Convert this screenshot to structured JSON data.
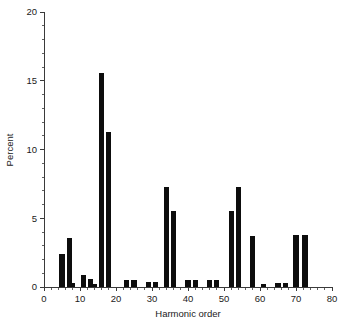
{
  "chart_data": {
    "type": "bar",
    "title": "",
    "subtitle": "",
    "xlabel": "Harmonic order",
    "ylabel": "Percent",
    "xlim": [
      0,
      80
    ],
    "ylim": [
      0,
      20
    ],
    "xticks": [
      0,
      10,
      20,
      30,
      40,
      50,
      60,
      70,
      80
    ],
    "yticks": [
      0,
      5,
      10,
      15,
      20
    ],
    "xtick_labels": [
      "0",
      "10",
      "20",
      "30",
      "40",
      "50",
      "60",
      "70",
      "80"
    ],
    "ytick_labels": [
      "0",
      "5",
      "10",
      "15",
      "20"
    ],
    "x_minor_tick_step": 2,
    "y_minor_tick_step": 1,
    "grid": false,
    "legend": null,
    "bar_color": "#0d0d0d",
    "bar_width": 1.4,
    "x": [
      5,
      7,
      8,
      11,
      13,
      14,
      16,
      18,
      23,
      25,
      29,
      31,
      34,
      36,
      40,
      42,
      46,
      48,
      52,
      54,
      58,
      61,
      65,
      67,
      70,
      72.5
    ],
    "values": [
      2.4,
      3.6,
      0.3,
      0.9,
      0.6,
      0.2,
      15.6,
      11.3,
      0.5,
      0.5,
      0.4,
      0.4,
      7.3,
      5.5,
      0.5,
      0.5,
      0.5,
      0.5,
      5.5,
      7.3,
      3.7,
      0.2,
      0.3,
      0.3,
      3.8,
      3.8
    ],
    "categories": [
      "5",
      "7",
      "8",
      "11",
      "13",
      "14",
      "16",
      "18",
      "23",
      "25",
      "29",
      "31",
      "34",
      "36",
      "40",
      "42",
      "46",
      "48",
      "52",
      "54",
      "58",
      "61",
      "65",
      "67",
      "70",
      "73"
    ]
  }
}
